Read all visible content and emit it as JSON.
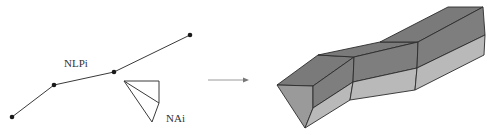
{
  "diagram": {
    "labels": {
      "polyline": "NLPi",
      "profile": "NAi"
    },
    "polyline": {
      "name": "NLPi",
      "vertex_count": 4
    },
    "profile": {
      "name": "NAi",
      "shape": "triangulated-quad"
    },
    "arrow": {
      "direction": "right",
      "meaning": "extrusion"
    },
    "result": {
      "segments": 3,
      "colors": {
        "top_face": "#7a7a7a",
        "front_face": "#7e7e7e",
        "lower_face": "#b9b9b9",
        "end_cap": "#9a9a9a",
        "edge": "#2b2b2b"
      }
    }
  }
}
